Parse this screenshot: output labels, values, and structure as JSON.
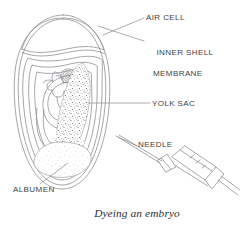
{
  "figure": {
    "title": "Dyeing an embryo",
    "caption": "Dyeing an embryo",
    "line_color": "#8a8a90",
    "text_color": "#3f3f44",
    "background": "#ffffff",
    "stipple_color": "#55555c"
  },
  "labels": {
    "air_cell": "AIR CELL",
    "inner_shell_line1": "INNER SHELL",
    "inner_shell_line2": "MEMBRANE",
    "yolk_sac": "YOLK SAC",
    "needle": "NEEDLE",
    "albumen": "ALBUMEN"
  },
  "parts": [
    {
      "name": "air-cell",
      "label": "AIR CELL"
    },
    {
      "name": "inner-shell-membrane",
      "label": "INNER SHELL MEMBRANE"
    },
    {
      "name": "yolk-sac",
      "label": "YOLK SAC"
    },
    {
      "name": "needle",
      "label": "NEEDLE"
    },
    {
      "name": "albumen",
      "label": "ALBUMEN"
    }
  ]
}
